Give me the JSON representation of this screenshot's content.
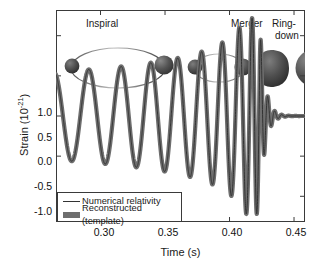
{
  "figure": {
    "y_axis_label_prefix": "Strain (10",
    "y_axis_label_exponent": "-21",
    "y_axis_label_suffix": ")",
    "x_axis_label": "Time (s)"
  },
  "annotations": {
    "inspiral": "Inspiral",
    "merger": "Merger",
    "ringdown_line1": "Ring-",
    "ringdown_line2": "down"
  },
  "legend": {
    "entries": [
      {
        "label": "Numerical relativity",
        "key": "thin-line",
        "color": "#333333"
      },
      {
        "label": "Reconstructed (template)",
        "key": "thick-band",
        "color": "#6e6e6e"
      }
    ]
  },
  "colors": {
    "numerical_relativity": "#333333",
    "reconstructed_band": "#6e6e6e",
    "axis": "#3a3a3a",
    "background": "#ffffff",
    "black_hole": "#4a4a4a"
  },
  "chart_data": {
    "type": "line",
    "title": "",
    "xlabel": "Time (s)",
    "ylabel": "Strain (10^-21)",
    "xlim": [
      0.2655,
      0.4585
    ],
    "ylim": [
      -1.32,
      1.32
    ],
    "xticks": [
      0.3,
      0.35,
      0.4,
      0.45
    ],
    "xtick_labels": [
      "0.30",
      "0.35",
      "0.40",
      "0.45"
    ],
    "yticks": [
      1.0,
      0.5,
      0.0,
      -0.5,
      -1.0
    ],
    "ytick_labels": [
      "1.0",
      "0.5",
      "0.0",
      "-0.5",
      "-1.0"
    ],
    "grid": false,
    "legend_position": "lower left",
    "series": [
      {
        "name": "Numerical relativity",
        "style": "thin-line",
        "color": "#333333",
        "linewidth": 1.0
      },
      {
        "name": "Reconstructed (template)",
        "style": "thick-band",
        "color": "#6e6e6e",
        "linewidth": 4.2
      }
    ],
    "waveform_model": {
      "description": "Binary black hole chirp: inspiral with rising amplitude and frequency, merger peak, exponential ringdown",
      "merger_time": 0.4232,
      "peak_strain": 1.22,
      "inspiral_start_time": 0.2655,
      "inspiral_start_amplitude": 0.55,
      "inspiral_start_frequency_hz": 36,
      "merger_frequency_hz": 142,
      "ringdown_frequency_hz": 185,
      "ringdown_decay_tau": 0.004,
      "band_halfwidth_start": 0.075,
      "band_halfwidth_end": 0.006,
      "phase_offset_rad": 1.9,
      "cycles_visible": 9
    },
    "cycle_peaks": [
      {
        "time": 0.2655,
        "strain": 0.52
      },
      {
        "time": 0.2805,
        "strain": -0.56
      },
      {
        "time": 0.2935,
        "strain": 0.55
      },
      {
        "time": 0.3075,
        "strain": -0.55
      },
      {
        "time": 0.3205,
        "strain": 0.57
      },
      {
        "time": 0.334,
        "strain": -0.57
      },
      {
        "time": 0.3465,
        "strain": 0.6
      },
      {
        "time": 0.36,
        "strain": -0.6
      },
      {
        "time": 0.372,
        "strain": 0.65
      },
      {
        "time": 0.3845,
        "strain": -0.68
      },
      {
        "time": 0.3955,
        "strain": 0.74
      },
      {
        "time": 0.406,
        "strain": -0.82
      },
      {
        "time": 0.415,
        "strain": 1.02
      },
      {
        "time": 0.4192,
        "strain": -1.1
      },
      {
        "time": 0.4232,
        "strain": 1.22
      },
      {
        "time": 0.4268,
        "strain": -1.18
      },
      {
        "time": 0.4305,
        "strain": 0.42
      },
      {
        "time": 0.4335,
        "strain": -0.22
      },
      {
        "time": 0.4365,
        "strain": 0.12
      },
      {
        "time": 0.44,
        "strain": -0.05
      }
    ]
  },
  "illustrations": {
    "stage_1": {
      "name": "inspiral-wide-orbit",
      "separation": "wide",
      "bodies": 2
    },
    "stage_2": {
      "name": "inspiral-tight-orbit",
      "separation": "narrow",
      "bodies": 2
    },
    "stage_3": {
      "name": "merger-peanut-shape",
      "bodies": 1
    },
    "stage_4": {
      "name": "ringdown-single-sphere",
      "bodies": 1
    }
  }
}
